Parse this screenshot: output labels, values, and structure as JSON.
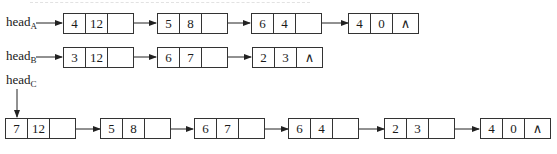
{
  "lists": [
    {
      "id": "A",
      "head_label": "head",
      "head_sub": "A",
      "nodes": [
        {
          "coef": "4",
          "exp": "12",
          "next": ""
        },
        {
          "coef": "5",
          "exp": "8",
          "next": ""
        },
        {
          "coef": "6",
          "exp": "4",
          "next": ""
        },
        {
          "coef": "4",
          "exp": "0",
          "next": "∧"
        }
      ]
    },
    {
      "id": "B",
      "head_label": "head",
      "head_sub": "B",
      "nodes": [
        {
          "coef": "3",
          "exp": "12",
          "next": ""
        },
        {
          "coef": "6",
          "exp": "7",
          "next": ""
        },
        {
          "coef": "2",
          "exp": "3",
          "next": "∧"
        }
      ]
    },
    {
      "id": "C",
      "head_label": "head",
      "head_sub": "C",
      "nodes": [
        {
          "coef": "7",
          "exp": "12",
          "next": ""
        },
        {
          "coef": "5",
          "exp": "8",
          "next": ""
        },
        {
          "coef": "6",
          "exp": "7",
          "next": ""
        },
        {
          "coef": "6",
          "exp": "4",
          "next": ""
        },
        {
          "coef": "2",
          "exp": "3",
          "next": ""
        },
        {
          "coef": "4",
          "exp": "0",
          "next": "∧"
        }
      ]
    }
  ],
  "colors": {
    "line": "#333333",
    "text": "#1a1a1a",
    "background": "#ffffff"
  },
  "icons": {
    "null_pointer": "∧",
    "arrow": "arrow-right"
  }
}
